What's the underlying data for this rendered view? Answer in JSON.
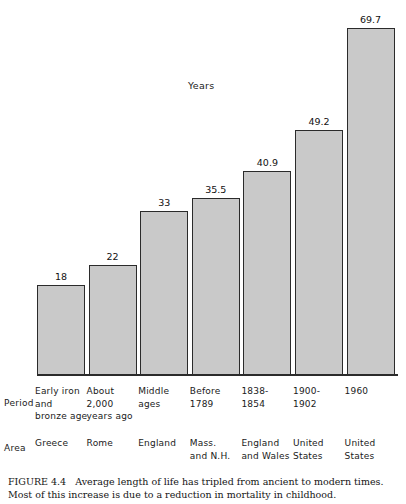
{
  "chart_data": {
    "type": "bar",
    "title": "",
    "ylabel": "Years",
    "xlabel": "",
    "ylim": [
      0,
      75
    ],
    "grid": false,
    "legend": "none",
    "categories": [
      "Early iron and bronze age",
      "About 2,000 years ago",
      "Middle ages",
      "Before 1789",
      "1838-1854",
      "1900-1902",
      "1960"
    ],
    "values": [
      18,
      22,
      33,
      35.5,
      40.9,
      49.2,
      69.7
    ],
    "value_labels": [
      "18",
      "22",
      "33",
      "35.5",
      "40.9",
      "49.2",
      "69.7"
    ],
    "series": [
      {
        "name": "Average length of life (years)",
        "values": [
          18,
          22,
          33,
          35.5,
          40.9,
          49.2,
          69.7
        ]
      }
    ],
    "bar_color": "#c9c9c9",
    "bar_border_color": "#2b2b2b"
  },
  "axis_labels": {
    "years_label": "Years",
    "period_row_label": "Period",
    "area_row_label": "Area"
  },
  "period_rows": [
    [
      "Early iron",
      "and",
      "bronze age"
    ],
    [
      "About",
      "2,000",
      "years ago"
    ],
    [
      "Middle",
      "ages"
    ],
    [
      "Before",
      "1789"
    ],
    [
      "1838-",
      "1854"
    ],
    [
      "1900-",
      "1902"
    ],
    [
      "1960"
    ]
  ],
  "area_rows": [
    [
      "Greece"
    ],
    [
      "Rome"
    ],
    [
      "England"
    ],
    [
      "Mass.",
      "and N.H."
    ],
    [
      "England",
      "and Wales"
    ],
    [
      "United",
      "States"
    ],
    [
      "United",
      "States"
    ]
  ],
  "caption": {
    "figure_number": "FIGURE 4.4",
    "text": "Average length of life has tripled from ancient to modern times. Most of this increase is due to a reduction in mortality in childhood."
  }
}
